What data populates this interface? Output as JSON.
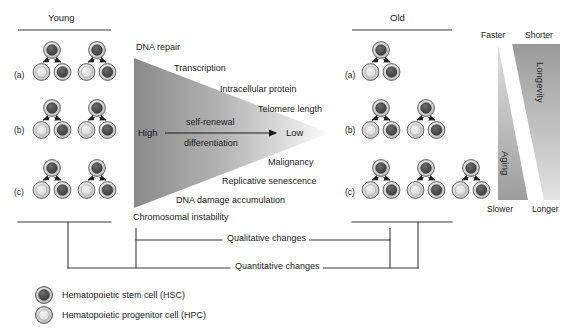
{
  "figure": {
    "title_young": "Young",
    "title_old": "Old",
    "row_labels": [
      "(a)",
      "(b)",
      "(c)"
    ]
  },
  "young_panel": {
    "label": "Young",
    "rows": [
      {
        "label": "(a)",
        "clusters": 2
      },
      {
        "label": "(b)",
        "clusters": 2
      },
      {
        "label": "(c)",
        "clusters": 2
      }
    ]
  },
  "old_panel": {
    "label": "Old",
    "rows": [
      {
        "label": "(a)",
        "clusters": 1
      },
      {
        "label": "(b)",
        "clusters": 2
      },
      {
        "label": "(c)",
        "clusters": 3
      }
    ]
  },
  "triangle": {
    "top_labels": [
      "DNA repair",
      "Transcription",
      "Intracellular protein",
      "Telomere length"
    ],
    "bottom_labels": [
      "Malignancy",
      "Replicative senescence",
      "DNA damage accumulation",
      "Chromosomal instability"
    ],
    "left_value": "High",
    "right_value": "Low",
    "arrow_above": "self-renewal",
    "arrow_below": "differentiation"
  },
  "brackets": {
    "qualitative": "Qualitative changes",
    "quantitative": "Quantitative changes"
  },
  "longevity_panel": {
    "top_left": "Faster",
    "top_right": "Shorter",
    "bottom_left": "Slower",
    "bottom_right": "Longer",
    "right_wedge_label": "Longevity",
    "left_wedge_label": "Aging"
  },
  "legend": {
    "items": [
      {
        "icon": "hsc-cell-icon",
        "label": "Hematopoietic stem cell (HSC)"
      },
      {
        "icon": "hpc-cell-icon",
        "label": "Hematopoietic progenitor cell (HPC)"
      }
    ]
  },
  "colors": {
    "hsc_core": "#4a4a4a",
    "hpc_core": "#d8d8d8",
    "cell_ring": "#c2c2c2",
    "cell_stroke": "#555555",
    "line": "#3a3a3a",
    "wedge_dark": "#8e8e8e",
    "wedge_light": "#f7f7f7"
  }
}
